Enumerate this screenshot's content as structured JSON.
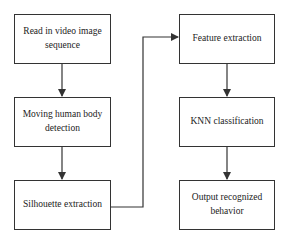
{
  "diagram": {
    "type": "flowchart",
    "nodes": [
      {
        "id": "n1",
        "label": "Read in video image sequence"
      },
      {
        "id": "n2",
        "label": "Moving human body detection"
      },
      {
        "id": "n3",
        "label": "Silhouette extraction"
      },
      {
        "id": "n4",
        "label": "Feature extraction"
      },
      {
        "id": "n5",
        "label": "KNN classification"
      },
      {
        "id": "n6",
        "label": "Output recognized behavior"
      }
    ],
    "edges": [
      {
        "from": "n1",
        "to": "n2"
      },
      {
        "from": "n2",
        "to": "n3"
      },
      {
        "from": "n3",
        "to": "n4"
      },
      {
        "from": "n4",
        "to": "n5"
      },
      {
        "from": "n5",
        "to": "n6"
      }
    ],
    "colors": {
      "stroke": "#333333",
      "background": "#ffffff",
      "text": "#222222"
    }
  }
}
